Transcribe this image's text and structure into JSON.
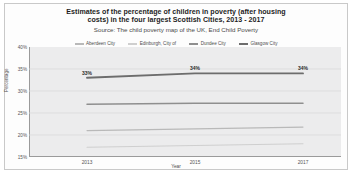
{
  "chart_data": {
    "type": "line",
    "title_lines": [
      "Estimates of the percentage of children in poverty (after housing",
      "costs) in the four largest Scottish Cities, 2013 - 2017"
    ],
    "subtitle": "Source: The child poverty map of the UK, End Child Poverty",
    "xlabel": "Year",
    "ylabel": "Percentage",
    "x": [
      "2013",
      "2015",
      "2017"
    ],
    "xtick_labels": [
      "2013",
      "2015",
      "2017"
    ],
    "ytick_labels": [
      "40%",
      "35%",
      "30%",
      "25%",
      "20%",
      "15%"
    ],
    "ytick_values": [
      40,
      35,
      30,
      25,
      20,
      15
    ],
    "ylim": [
      15,
      40
    ],
    "grid": true,
    "legend_position": "top",
    "series": [
      {
        "name": "Aberdeen City",
        "color": "#b9b9b9",
        "values": [
          21.0,
          21.4,
          21.8
        ],
        "labels": [
          "",
          "",
          ""
        ]
      },
      {
        "name": "Edinburgh, City of",
        "color": "#cfcfcf",
        "values": [
          17.2,
          17.6,
          18.0
        ],
        "labels": [
          "",
          "",
          ""
        ]
      },
      {
        "name": "Dundee City",
        "color": "#8f8f8f",
        "values": [
          27.0,
          27.2,
          27.2
        ],
        "labels": [
          "",
          "",
          ""
        ]
      },
      {
        "name": "Glasgow City",
        "color": "#6d6d6d",
        "values": [
          33.0,
          34.0,
          34.0
        ],
        "labels": [
          "33%",
          "34%",
          "34%"
        ]
      }
    ]
  }
}
